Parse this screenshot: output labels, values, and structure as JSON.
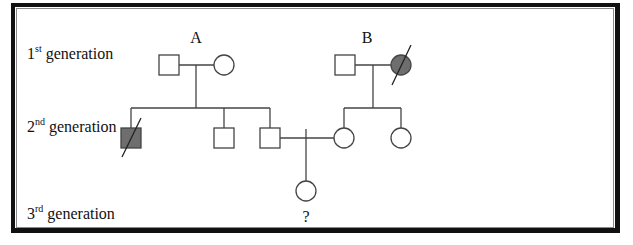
{
  "generations": [
    {
      "num": "1",
      "suffix": "st",
      "text": " generation"
    },
    {
      "num": "2",
      "suffix": "nd",
      "text": " generation"
    },
    {
      "num": "3",
      "suffix": "rd",
      "text": " generation"
    }
  ],
  "families": {
    "A": "A",
    "B": "B"
  },
  "unknown_label": "?",
  "colors": {
    "affected_fill": "#6e6e6e",
    "line": "#444444",
    "unaffected_fill": "#ffffff"
  },
  "individuals": [
    {
      "id": "A-father",
      "generation": 1,
      "sex": "male",
      "affected": false,
      "deceased": false
    },
    {
      "id": "A-mother",
      "generation": 1,
      "sex": "female",
      "affected": false,
      "deceased": false
    },
    {
      "id": "B-father",
      "generation": 1,
      "sex": "male",
      "affected": false,
      "deceased": false
    },
    {
      "id": "B-mother",
      "generation": 1,
      "sex": "female",
      "affected": true,
      "deceased": true
    },
    {
      "id": "A-son-1",
      "generation": 2,
      "sex": "male",
      "affected": true,
      "deceased": true
    },
    {
      "id": "A-son-2",
      "generation": 2,
      "sex": "male",
      "affected": false,
      "deceased": false
    },
    {
      "id": "A-son-3",
      "generation": 2,
      "sex": "male",
      "affected": false,
      "deceased": false
    },
    {
      "id": "B-daughter-1",
      "generation": 2,
      "sex": "female",
      "affected": false,
      "deceased": false
    },
    {
      "id": "B-daughter-2",
      "generation": 2,
      "sex": "female",
      "affected": false,
      "deceased": false
    },
    {
      "id": "child",
      "generation": 3,
      "sex": "female",
      "affected": null,
      "deceased": false
    }
  ]
}
